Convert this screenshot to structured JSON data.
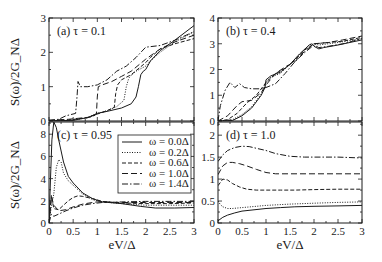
{
  "figure": {
    "ylabel": "S(ω)/2G_NΔ",
    "xlabel": "eV/Δ"
  },
  "legend": {
    "entries": [
      {
        "label": "ω = 0.0Δ",
        "dash": ""
      },
      {
        "label": "ω = 0.2Δ",
        "dash": "1,1.5"
      },
      {
        "label": "ω = 0.6Δ",
        "dash": "4,2"
      },
      {
        "label": "ω = 1.0Δ",
        "dash": "6,3"
      },
      {
        "label": "ω = 1.4Δ",
        "dash": "6,2,1.5,2"
      }
    ]
  },
  "chart_data": [
    {
      "panel": "a",
      "type": "line",
      "title": "(a) τ = 0.1",
      "xlabel": "",
      "ylabel": "S(ω)/2G_NΔ",
      "xlim": [
        0,
        3
      ],
      "ylim": [
        0,
        3
      ],
      "xticks": [
        0,
        0.5,
        1,
        1.5,
        2,
        2.5,
        3
      ],
      "yticks": [
        0,
        1,
        2,
        3
      ],
      "show_xticklabels": false,
      "series": [
        {
          "name": "ω = 0.0Δ",
          "x": [
            0,
            0.5,
            0.8,
            1.0,
            1.2,
            1.5,
            1.7,
            1.8,
            1.85,
            1.9,
            1.95,
            2.0,
            2.1,
            2.3,
            2.6,
            3.0
          ],
          "y": [
            0,
            0.02,
            0.1,
            0.22,
            0.28,
            0.38,
            0.5,
            0.7,
            1.0,
            1.35,
            1.45,
            1.5,
            1.75,
            2.05,
            2.35,
            2.78
          ]
        },
        {
          "name": "ω = 0.2Δ",
          "x": [
            0,
            0.5,
            0.8,
            1.0,
            1.2,
            1.4,
            1.55,
            1.6,
            1.65,
            1.7,
            1.8,
            2.0,
            2.1,
            2.3,
            2.6,
            3.0
          ],
          "y": [
            0,
            0.03,
            0.1,
            0.22,
            0.3,
            0.42,
            0.6,
            1.0,
            1.25,
            1.33,
            1.45,
            1.6,
            1.75,
            2.0,
            2.3,
            2.6
          ]
        },
        {
          "name": "ω = 0.6Δ",
          "x": [
            0,
            0.4,
            0.8,
            1.0,
            1.2,
            1.35,
            1.38,
            1.42,
            1.5,
            1.7,
            2.0,
            2.1,
            2.3,
            2.6,
            3.0
          ],
          "y": [
            0,
            0.03,
            0.1,
            0.2,
            0.3,
            0.4,
            0.8,
            1.05,
            1.2,
            1.35,
            1.7,
            1.85,
            2.1,
            2.25,
            2.4
          ]
        },
        {
          "name": "ω = 1.0Δ",
          "x": [
            0,
            0.4,
            0.75,
            0.9,
            0.98,
            1.0,
            1.02,
            1.1,
            1.3,
            1.5,
            1.7,
            2.0,
            2.3,
            2.6,
            3.0
          ],
          "y": [
            0.02,
            0.05,
            0.1,
            0.12,
            0.2,
            0.7,
            1.0,
            1.05,
            1.15,
            1.3,
            1.45,
            1.8,
            2.1,
            2.3,
            2.5
          ]
        },
        {
          "name": "ω = 1.4Δ",
          "x": [
            0,
            0.2,
            0.35,
            0.55,
            0.58,
            0.6,
            0.65,
            0.8,
            1.0,
            1.2,
            1.4,
            1.6,
            1.8,
            2.0,
            2.3,
            2.6,
            3.0
          ],
          "y": [
            0.02,
            0.05,
            0.15,
            0.22,
            0.7,
            1.15,
            1.0,
            1.0,
            1.05,
            1.2,
            1.45,
            1.6,
            1.85,
            2.15,
            2.2,
            2.35,
            2.6
          ]
        }
      ]
    },
    {
      "panel": "b",
      "type": "line",
      "title": "(b) τ = 0.4",
      "xlabel": "",
      "ylabel": "",
      "xlim": [
        0,
        3
      ],
      "ylim": [
        0,
        4
      ],
      "xticks": [
        0,
        0.5,
        1,
        1.5,
        2,
        2.5,
        3
      ],
      "yticks": [
        0,
        1,
        2,
        3,
        4
      ],
      "show_xticklabels": false,
      "series": [
        {
          "name": "ω = 0.0Δ",
          "x": [
            0,
            0.3,
            0.5,
            0.7,
            0.9,
            0.98,
            1.0,
            1.1,
            1.3,
            1.5,
            1.7,
            1.9,
            1.95,
            2.0,
            2.1,
            2.2,
            2.5,
            3.0
          ],
          "y": [
            0,
            0.02,
            0.2,
            0.5,
            1.0,
            1.3,
            1.6,
            1.75,
            1.9,
            2.2,
            2.6,
            2.95,
            3.0,
            2.9,
            2.8,
            2.85,
            2.95,
            3.15
          ]
        },
        {
          "name": "ω = 0.2Δ",
          "x": [
            0,
            0.3,
            0.5,
            0.7,
            0.9,
            1.0,
            1.1,
            1.3,
            1.5,
            1.7,
            1.9,
            2.0,
            2.1,
            2.5,
            3.0
          ],
          "y": [
            0,
            0.05,
            0.25,
            0.55,
            1.05,
            1.5,
            1.7,
            1.85,
            2.2,
            2.6,
            2.95,
            3.0,
            2.95,
            3.05,
            3.2
          ]
        },
        {
          "name": "ω = 0.6Δ",
          "x": [
            0,
            0.2,
            0.4,
            0.6,
            0.8,
            1.0,
            1.2,
            1.4,
            1.6,
            1.8,
            2.0,
            2.3,
            2.6,
            3.0
          ],
          "y": [
            0,
            0.05,
            0.3,
            0.7,
            1.0,
            1.5,
            1.85,
            2.05,
            2.35,
            2.75,
            3.0,
            3.05,
            3.1,
            3.25
          ]
        },
        {
          "name": "ω = 1.0Δ",
          "x": [
            0,
            0.2,
            0.4,
            0.5,
            0.7,
            0.9,
            1.0,
            1.2,
            1.4,
            1.6,
            1.8,
            2.0,
            2.3,
            2.6,
            3.0
          ],
          "y": [
            0,
            0.2,
            0.6,
            0.75,
            0.8,
            1.1,
            1.4,
            1.85,
            2.1,
            2.3,
            2.7,
            3.0,
            3.05,
            3.15,
            3.3
          ]
        },
        {
          "name": "ω = 1.4Δ",
          "x": [
            0,
            0.05,
            0.15,
            0.25,
            0.35,
            0.45,
            0.55,
            0.7,
            0.9,
            1.0,
            1.2,
            1.4,
            1.6,
            1.8,
            2.0,
            2.1,
            2.3,
            2.6,
            3.0
          ],
          "y": [
            0,
            0.6,
            1.2,
            1.5,
            1.3,
            1.45,
            1.3,
            1.25,
            1.25,
            1.3,
            1.45,
            1.85,
            2.3,
            2.65,
            2.95,
            2.85,
            2.9,
            3.0,
            3.2
          ]
        }
      ]
    },
    {
      "panel": "c",
      "type": "line",
      "title": "(c) τ = 0.95",
      "xlabel": "eV/Δ",
      "ylabel": "S(ω)/2G_NΔ",
      "xlim": [
        0,
        3
      ],
      "ylim": [
        0,
        9.1
      ],
      "xticks": [
        0,
        0.5,
        1,
        1.5,
        2,
        2.5,
        3
      ],
      "xticklabels": [
        "0",
        "0.5",
        "1",
        "1.5",
        "2",
        "2.5",
        "3"
      ],
      "yticks": [
        0,
        2,
        4,
        6,
        8
      ],
      "show_xticklabels": true,
      "series": [
        {
          "name": "ω = 0.0Δ",
          "x": [
            0,
            0.03,
            0.06,
            0.1,
            0.15,
            0.2,
            0.3,
            0.4,
            0.5,
            0.7,
            0.9,
            1.1,
            1.5,
            1.9,
            2.2,
            2.6,
            3.0
          ],
          "y": [
            0,
            4.0,
            7.5,
            9.1,
            8.6,
            7.5,
            5.5,
            4.2,
            3.6,
            2.7,
            2.2,
            1.9,
            1.75,
            1.5,
            1.35,
            1.35,
            1.4
          ]
        },
        {
          "name": "ω = 0.2Δ",
          "x": [
            0,
            0.05,
            0.1,
            0.15,
            0.2,
            0.25,
            0.3,
            0.4,
            0.5,
            0.7,
            0.9,
            1.1,
            1.5,
            2.0,
            2.5,
            3.0
          ],
          "y": [
            0,
            1.5,
            2.6,
            5.0,
            5.7,
            5.5,
            4.5,
            3.8,
            3.4,
            2.6,
            2.1,
            1.9,
            1.75,
            1.6,
            1.6,
            1.6
          ]
        },
        {
          "name": "ω = 0.6Δ",
          "x": [
            0,
            0.05,
            0.1,
            0.2,
            0.3,
            0.4,
            0.5,
            0.6,
            0.7,
            0.9,
            1.1,
            1.5,
            2.0,
            2.5,
            3.0
          ],
          "y": [
            0,
            2.5,
            1.3,
            1.2,
            1.6,
            2.0,
            2.3,
            2.45,
            2.4,
            2.2,
            1.95,
            1.8,
            1.75,
            1.75,
            1.8
          ]
        },
        {
          "name": "ω = 1.0Δ",
          "x": [
            0,
            0.05,
            0.1,
            0.2,
            0.35,
            0.5,
            0.7,
            0.9,
            1.0,
            1.2,
            1.5,
            2.0,
            2.5,
            3.0
          ],
          "y": [
            0,
            2.4,
            1.6,
            1.1,
            1.2,
            1.45,
            1.7,
            1.85,
            1.9,
            1.9,
            1.85,
            1.85,
            1.85,
            1.85
          ]
        },
        {
          "name": "ω = 1.4Δ",
          "x": [
            0,
            0.05,
            0.1,
            0.2,
            0.35,
            0.5,
            0.7,
            0.9,
            1.1,
            1.3,
            1.5,
            2.0,
            2.5,
            3.0
          ],
          "y": [
            0,
            0.8,
            0.6,
            0.8,
            1.1,
            1.35,
            1.6,
            1.75,
            1.85,
            1.85,
            1.9,
            1.95,
            1.95,
            1.95
          ]
        }
      ]
    },
    {
      "panel": "d",
      "type": "line",
      "title": "(d) τ = 1.0",
      "xlabel": "eV/Δ",
      "ylabel": "",
      "xlim": [
        0,
        3
      ],
      "ylim": [
        0,
        2.3
      ],
      "xticks": [
        0,
        0.5,
        1,
        1.5,
        2,
        2.5,
        3
      ],
      "xticklabels": [
        "0",
        "0.5",
        "1",
        "1.5",
        "2",
        "2.5",
        "3"
      ],
      "yticks": [
        0,
        0.5,
        1,
        1.5,
        2
      ],
      "yticklabels": [
        "0",
        "0.5",
        "1",
        "1.5",
        "2"
      ],
      "show_xticklabels": true,
      "series": [
        {
          "name": "ω = 0.0Δ",
          "x": [
            0,
            0.1,
            0.2,
            0.35,
            0.5,
            0.75,
            1.0,
            1.3,
            1.6,
            2.0,
            2.5,
            3.0
          ],
          "y": [
            0.05,
            0.13,
            0.18,
            0.23,
            0.27,
            0.3,
            0.33,
            0.35,
            0.37,
            0.38,
            0.39,
            0.4
          ]
        },
        {
          "name": "ω = 0.2Δ",
          "x": [
            0,
            0.05,
            0.1,
            0.2,
            0.3,
            0.5,
            0.8,
            1.0,
            1.5,
            2.0,
            2.5,
            3.0
          ],
          "y": [
            0.5,
            0.42,
            0.37,
            0.33,
            0.33,
            0.35,
            0.38,
            0.4,
            0.43,
            0.45,
            0.47,
            0.48
          ]
        },
        {
          "name": "ω = 0.6Δ",
          "x": [
            0,
            0.1,
            0.2,
            0.3,
            0.45,
            0.6,
            0.8,
            1.0,
            1.3,
            1.6,
            2.0,
            2.5,
            3.0
          ],
          "y": [
            0.85,
            1.0,
            0.98,
            0.9,
            0.82,
            0.77,
            0.75,
            0.75,
            0.75,
            0.75,
            0.76,
            0.77,
            0.77
          ]
        },
        {
          "name": "ω = 1.0Δ",
          "x": [
            0,
            0.1,
            0.2,
            0.3,
            0.45,
            0.6,
            0.8,
            1.0,
            1.2,
            1.5,
            2.0,
            2.5,
            3.0
          ],
          "y": [
            1.1,
            1.3,
            1.38,
            1.38,
            1.35,
            1.3,
            1.22,
            1.15,
            1.12,
            1.12,
            1.12,
            1.12,
            1.12
          ]
        },
        {
          "name": "ω = 1.4Δ",
          "x": [
            0,
            0.1,
            0.2,
            0.35,
            0.5,
            0.65,
            0.8,
            1.0,
            1.2,
            1.5,
            1.8,
            2.0,
            2.5,
            3.0
          ],
          "y": [
            1.4,
            1.55,
            1.65,
            1.72,
            1.75,
            1.74,
            1.7,
            1.65,
            1.58,
            1.52,
            1.5,
            1.5,
            1.5,
            1.48
          ]
        }
      ]
    }
  ]
}
